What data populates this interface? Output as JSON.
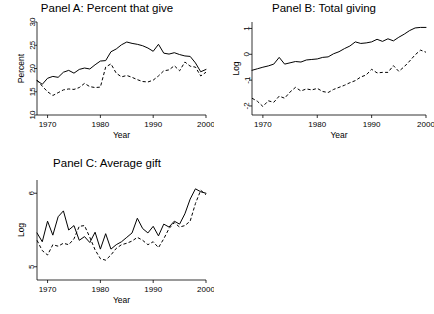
{
  "figure": {
    "background": "#ffffff",
    "line_color": "#000000",
    "panel_count": 3
  },
  "chart_data": [
    {
      "id": "panel_a",
      "type": "line",
      "title": "Panel A: Percent that give",
      "xlabel": "Year",
      "ylabel": "Percent",
      "xlim": [
        1968,
        2000
      ],
      "ylim": [
        10,
        30
      ],
      "xticks": [
        1970,
        1980,
        1990,
        2000
      ],
      "yticks": [
        10,
        15,
        20,
        25,
        30
      ],
      "xtick_labels": [
        "1970",
        "1980",
        "1990",
        "2000"
      ],
      "ytick_labels": [
        "10",
        "15",
        "20",
        "25",
        "30"
      ],
      "grid": false,
      "legend": "none",
      "x": [
        1968,
        1969,
        1970,
        1971,
        1972,
        1973,
        1974,
        1975,
        1976,
        1977,
        1978,
        1979,
        1980,
        1981,
        1982,
        1983,
        1984,
        1985,
        1986,
        1987,
        1988,
        1989,
        1990,
        1991,
        1992,
        1993,
        1994,
        1995,
        1996,
        1997,
        1998,
        1999,
        2000
      ],
      "series": [
        {
          "name": "solid-series",
          "style": "solid",
          "values": [
            17.4,
            16.6,
            17.9,
            18.3,
            18.1,
            19.2,
            19.6,
            19.0,
            19.8,
            20.1,
            19.9,
            20.8,
            21.6,
            21.7,
            23.6,
            24.2,
            25.1,
            25.7,
            25.4,
            25.2,
            24.9,
            24.4,
            23.7,
            25.2,
            23.3,
            23.1,
            23.4,
            23.0,
            22.7,
            22.6,
            21.2,
            19.3,
            19.8
          ]
        },
        {
          "name": "dashed-series",
          "style": "dashed",
          "values": [
            17.5,
            16.2,
            15.0,
            14.2,
            14.8,
            15.4,
            15.6,
            15.5,
            15.9,
            16.8,
            16.1,
            15.9,
            16.0,
            20.3,
            21.0,
            19.0,
            18.2,
            18.5,
            18.1,
            17.6,
            17.2,
            17.1,
            17.5,
            18.4,
            19.5,
            19.7,
            20.6,
            19.5,
            21.4,
            20.5,
            20.3,
            18.4,
            19.2
          ]
        }
      ]
    },
    {
      "id": "panel_b",
      "type": "line",
      "title": "Panel B: Total giving",
      "xlabel": "Year",
      "ylabel": "Log",
      "xlim": [
        1968,
        2000
      ],
      "ylim": [
        -2.35,
        1.25
      ],
      "xticks": [
        1970,
        1980,
        1990,
        2000
      ],
      "yticks": [
        -2,
        -1,
        0,
        1
      ],
      "xtick_labels": [
        "1970",
        "1980",
        "1990",
        "2000"
      ],
      "ytick_labels": [
        "-2",
        "-1",
        "0",
        "1"
      ],
      "grid": false,
      "legend": "none",
      "x": [
        1968,
        1969,
        1970,
        1971,
        1972,
        1973,
        1974,
        1975,
        1976,
        1977,
        1978,
        1979,
        1980,
        1981,
        1982,
        1983,
        1984,
        1985,
        1986,
        1987,
        1988,
        1989,
        1990,
        1991,
        1992,
        1993,
        1994,
        1995,
        1996,
        1997,
        1998,
        1999,
        2000
      ],
      "series": [
        {
          "name": "solid-series",
          "style": "solid",
          "values": [
            -0.62,
            -0.56,
            -0.5,
            -0.45,
            -0.38,
            -0.12,
            -0.38,
            -0.33,
            -0.28,
            -0.3,
            -0.22,
            -0.2,
            -0.18,
            -0.12,
            -0.1,
            0.02,
            0.1,
            0.22,
            0.32,
            0.48,
            0.42,
            0.44,
            0.48,
            0.58,
            0.5,
            0.6,
            0.52,
            0.66,
            0.78,
            0.92,
            1.02,
            1.04,
            1.04
          ]
        },
        {
          "name": "dashed-series",
          "style": "dashed",
          "values": [
            -1.7,
            -1.82,
            -2.02,
            -1.8,
            -1.86,
            -1.62,
            -1.7,
            -1.46,
            -1.28,
            -1.42,
            -1.34,
            -1.38,
            -1.32,
            -1.44,
            -1.48,
            -1.36,
            -1.28,
            -1.2,
            -1.1,
            -1.02,
            -0.88,
            -0.8,
            -0.58,
            -0.72,
            -0.7,
            -0.7,
            -0.44,
            -0.66,
            -0.48,
            -0.26,
            -0.02,
            0.16,
            0.08
          ]
        }
      ]
    },
    {
      "id": "panel_c",
      "type": "line",
      "title": "Panel C: Average gift",
      "xlabel": "Year",
      "ylabel": "Log",
      "xlim": [
        1968,
        2000
      ],
      "ylim": [
        4.82,
        6.18
      ],
      "xticks": [
        1970,
        1980,
        1990,
        2000
      ],
      "yticks": [
        5,
        6
      ],
      "xtick_labels": [
        "5",
        "6"
      ],
      "ytick_labels": [
        "5",
        "6"
      ],
      "grid": false,
      "legend": "none",
      "x": [
        1968,
        1969,
        1970,
        1971,
        1972,
        1973,
        1974,
        1975,
        1976,
        1977,
        1978,
        1979,
        1980,
        1981,
        1982,
        1983,
        1984,
        1985,
        1986,
        1987,
        1988,
        1989,
        1990,
        1991,
        1992,
        1993,
        1994,
        1995,
        1996,
        1997,
        1998,
        1999,
        2000
      ],
      "series": [
        {
          "name": "solid-series",
          "style": "solid",
          "values": [
            5.46,
            5.34,
            5.62,
            5.43,
            5.68,
            5.76,
            5.5,
            5.56,
            5.36,
            5.41,
            5.33,
            5.47,
            5.24,
            5.45,
            5.24,
            5.3,
            5.34,
            5.4,
            5.46,
            5.66,
            5.52,
            5.46,
            5.55,
            5.42,
            5.58,
            5.54,
            5.62,
            5.58,
            5.72,
            5.92,
            6.06,
            6.02,
            6.0
          ]
        },
        {
          "name": "dashed-series",
          "style": "dashed",
          "values": [
            5.36,
            5.22,
            5.16,
            5.3,
            5.28,
            5.32,
            5.3,
            5.38,
            5.55,
            5.56,
            5.4,
            5.23,
            5.11,
            5.09,
            5.16,
            5.25,
            5.3,
            5.32,
            5.35,
            5.4,
            5.36,
            5.3,
            5.34,
            5.26,
            5.38,
            5.52,
            5.6,
            5.54,
            5.56,
            5.62,
            5.86,
            6.04,
            5.98
          ]
        }
      ]
    }
  ]
}
